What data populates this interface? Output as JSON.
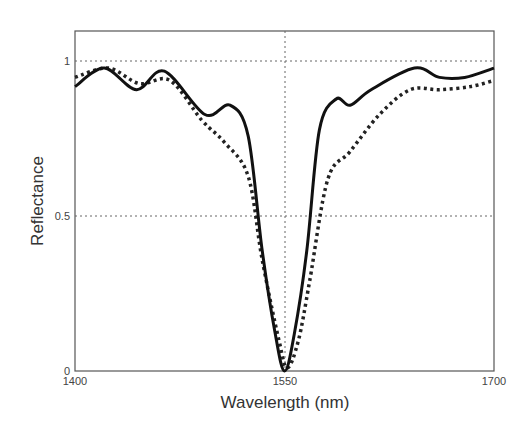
{
  "chart_data": {
    "type": "line",
    "title": "",
    "xlabel": "Wavelength (nm)",
    "ylabel": "Reflectance",
    "xlim": [
      1400,
      1700
    ],
    "ylim": [
      0,
      1.1
    ],
    "xticks": [
      1400,
      1550,
      1700
    ],
    "xtick_labels": [
      "1400",
      "1550",
      "1700"
    ],
    "yticks": [
      0,
      0.5,
      1
    ],
    "ytick_labels": [
      "0",
      "0.5",
      "1"
    ],
    "grid": "dotted lines at x=1550, y=0.5, y=1",
    "legend": null,
    "series": [
      {
        "name": "solid",
        "style": "solid",
        "color": "#111111",
        "x": [
          1400,
          1421,
          1444,
          1464,
          1493,
          1511,
          1524,
          1534,
          1543,
          1550,
          1557,
          1566,
          1575,
          1587,
          1597,
          1612,
          1643,
          1661,
          1679,
          1700
        ],
        "y": [
          0.92,
          0.98,
          0.91,
          0.97,
          0.83,
          0.86,
          0.76,
          0.39,
          0.13,
          0.0,
          0.12,
          0.39,
          0.78,
          0.88,
          0.86,
          0.91,
          0.98,
          0.95,
          0.95,
          0.98
        ]
      },
      {
        "name": "dotted",
        "style": "dotted",
        "color": "#222222",
        "x": [
          1400,
          1424,
          1446,
          1468,
          1491,
          1507,
          1524,
          1534,
          1546,
          1552,
          1560,
          1568,
          1581,
          1597,
          1618,
          1640,
          1661,
          1683,
          1700
        ],
        "y": [
          0.95,
          0.98,
          0.93,
          0.94,
          0.81,
          0.74,
          0.63,
          0.36,
          0.1,
          0.01,
          0.1,
          0.29,
          0.62,
          0.71,
          0.83,
          0.91,
          0.91,
          0.92,
          0.94
        ]
      }
    ]
  },
  "plot": {
    "xlabel": "Wavelength (nm)",
    "ylabel": "Reflectance",
    "xtick_labels": [
      "1400",
      "1550",
      "1700"
    ],
    "ytick_labels": [
      "0",
      "0.5",
      "1"
    ]
  }
}
